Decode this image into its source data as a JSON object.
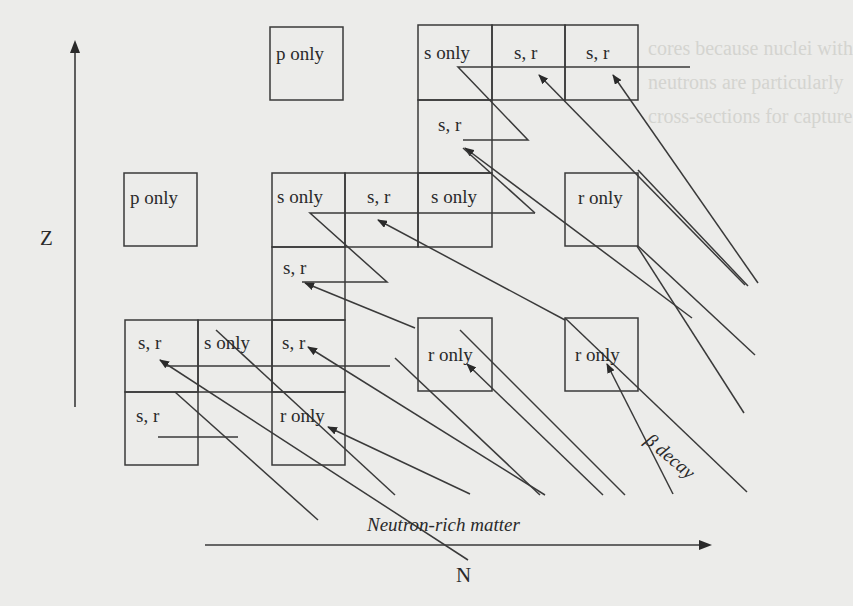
{
  "diagram": {
    "axes": {
      "y_label": "Z",
      "x_label": "N"
    },
    "annotations": {
      "beta_decay": "β decay",
      "neutron_rich": "Neutron-rich matter"
    },
    "cells": [
      {
        "id": "p1",
        "label": "p only",
        "x": 270,
        "y": 27,
        "w": 73,
        "h": 73
      },
      {
        "id": "p2",
        "label": "p only",
        "x": 124,
        "y": 173,
        "w": 73,
        "h": 73
      },
      {
        "id": "tg1",
        "label": "s only",
        "x": 418,
        "y": 25,
        "w": 74,
        "h": 75
      },
      {
        "id": "tg2",
        "label": "s, r",
        "x": 492,
        "y": 25,
        "w": 73,
        "h": 75
      },
      {
        "id": "tg3",
        "label": "s, r",
        "x": 565,
        "y": 25,
        "w": 73,
        "h": 75
      },
      {
        "id": "tg4",
        "label": "s, r",
        "x": 418,
        "y": 100,
        "w": 74,
        "h": 73
      },
      {
        "id": "mg1",
        "label": "s only",
        "x": 272,
        "y": 173,
        "w": 73,
        "h": 74
      },
      {
        "id": "mg2",
        "label": "s, r",
        "x": 345,
        "y": 173,
        "w": 73,
        "h": 74
      },
      {
        "id": "mg3",
        "label": "s only",
        "x": 418,
        "y": 173,
        "w": 74,
        "h": 74
      },
      {
        "id": "mg4",
        "label": "s, r",
        "x": 272,
        "y": 247,
        "w": 73,
        "h": 73
      },
      {
        "id": "lg1",
        "label": "s, r",
        "x": 125,
        "y": 320,
        "w": 73,
        "h": 72
      },
      {
        "id": "lg2",
        "label": "s only",
        "x": 198,
        "y": 320,
        "w": 74,
        "h": 72
      },
      {
        "id": "lg3",
        "label": "s, r",
        "x": 272,
        "y": 320,
        "w": 73,
        "h": 72
      },
      {
        "id": "lg4",
        "label": "s, r",
        "x": 125,
        "y": 392,
        "w": 73,
        "h": 73
      },
      {
        "id": "lg5",
        "label": "",
        "x": 198,
        "y": 392,
        "w": 74,
        "h": 73
      },
      {
        "id": "lg6",
        "label": "r only",
        "x": 272,
        "y": 392,
        "w": 73,
        "h": 73
      },
      {
        "id": "r1",
        "label": "r only",
        "x": 565,
        "y": 173,
        "w": 73,
        "h": 73
      },
      {
        "id": "r2",
        "label": "r only",
        "x": 418,
        "y": 318,
        "w": 74,
        "h": 73
      },
      {
        "id": "r3",
        "label": "r only",
        "x": 565,
        "y": 318,
        "w": 73,
        "h": 73
      }
    ],
    "process_labels": {
      "s_only": "s only",
      "s_r": "s, r",
      "r_only": "r only",
      "p_only": "p only"
    }
  },
  "background_text": [
    "...his same trend the",
    "...ected 1. besides",
    "...8 located far off",
    "these nuclei",
    "...nery of the neutron",
    "...e 2.1.3 stars",
    "...eration and direct...",
    "...bedore following",
    "...d the world were",
    "...y using the entire",
    "Although...",
    "...uminous than neutron",
    "...ontained more quickly",
    "...s remain elements",
    "...of excited neutrons",
    "...c 0.1-0.05 M",
    "...0.7 ... spectra",
    "...spectra revealed this"
  ]
}
